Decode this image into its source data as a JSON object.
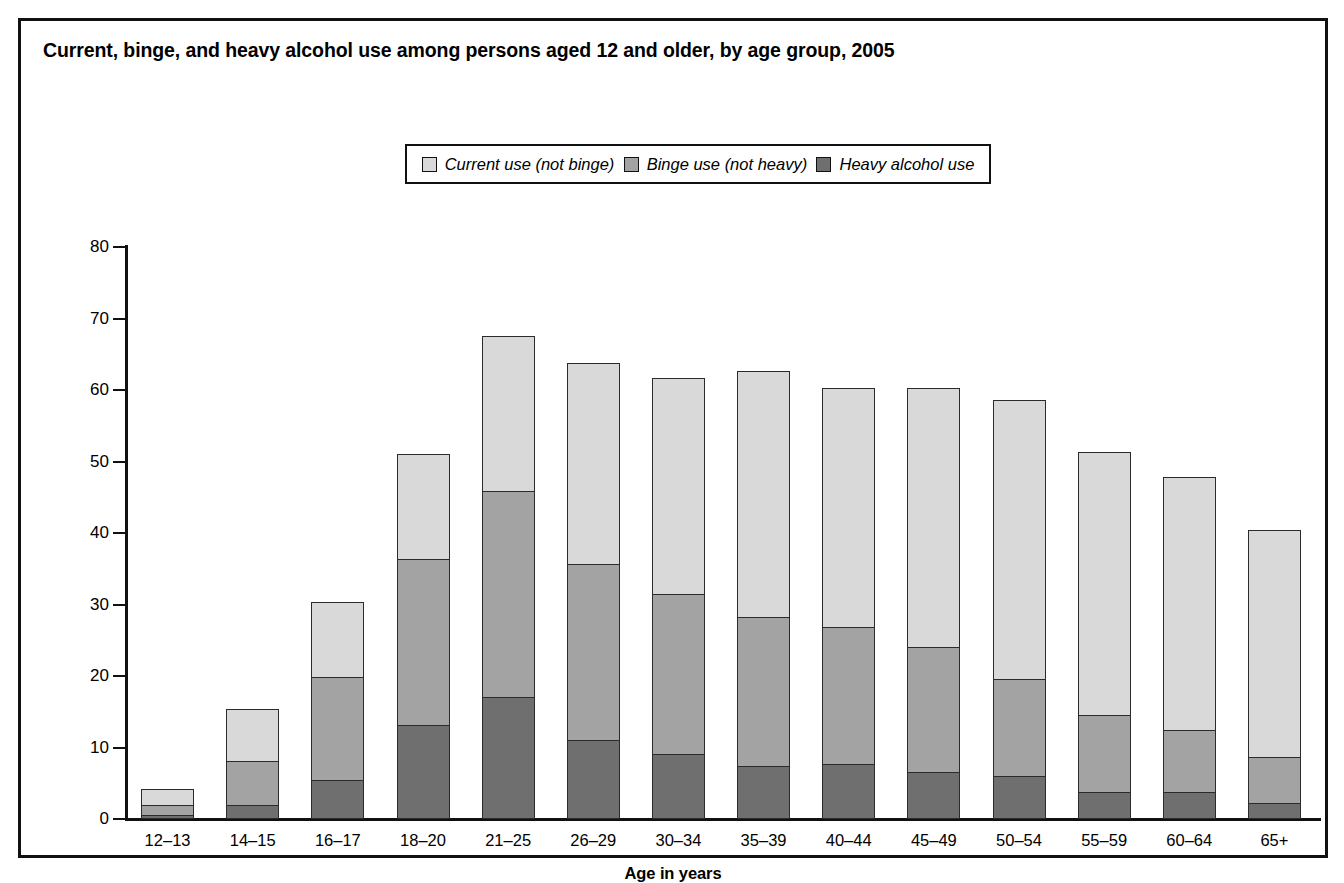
{
  "figure": {
    "title": "Current, binge, and heavy alcohol use among persons aged 12 and older, by age group, 2005"
  },
  "legend": {
    "items": [
      {
        "label": "Current use (not binge)",
        "icon": "legend-swatch-light",
        "color": "#d9d9d9"
      },
      {
        "label": "Binge use (not heavy)",
        "icon": "legend-swatch-medium",
        "color": "#a3a3a3"
      },
      {
        "label": "Heavy alcohol use",
        "icon": "legend-swatch-dark",
        "color": "#6f6f6f"
      }
    ]
  },
  "chart_data": {
    "type": "bar",
    "stacked": true,
    "title": "Current, binge, and heavy alcohol use among persons aged 12 and older, by age group, 2005",
    "xlabel": "Age in years",
    "ylabel": "Percent using in past month",
    "ylim": [
      0,
      80
    ],
    "yticks": [
      0,
      10,
      20,
      30,
      40,
      50,
      60,
      70,
      80
    ],
    "ytick_labels": [
      "0",
      "10",
      "20",
      "30",
      "40",
      "50",
      "60",
      "70",
      "80"
    ],
    "grid": false,
    "legend_position": "top-center",
    "categories": [
      "12–13",
      "14–15",
      "16–17",
      "18–20",
      "21–25",
      "26–29",
      "30–34",
      "35–39",
      "40–44",
      "45–49",
      "50–54",
      "55–59",
      "60–64",
      "65+"
    ],
    "series": [
      {
        "name": "Heavy alcohol use",
        "color": "#6f6f6f",
        "values": [
          0.6,
          2.0,
          5.5,
          13.2,
          17.1,
          11.1,
          9.1,
          7.4,
          7.7,
          6.6,
          6.0,
          3.8,
          3.8,
          2.3
        ]
      },
      {
        "name": "Binge use (not heavy)",
        "color": "#a3a3a3",
        "values": [
          1.4,
          6.1,
          14.4,
          23.2,
          28.8,
          24.5,
          22.4,
          20.8,
          19.1,
          17.4,
          13.6,
          10.7,
          8.7,
          6.4
        ]
      },
      {
        "name": "Current use (not binge)",
        "color": "#d9d9d9",
        "values": [
          2.2,
          7.3,
          10.5,
          14.7,
          21.7,
          28.2,
          30.2,
          34.4,
          33.5,
          36.3,
          39.0,
          36.8,
          35.3,
          31.7
        ]
      }
    ],
    "totals": [
      4.2,
      15.4,
      30.4,
      51.1,
      67.6,
      63.8,
      61.7,
      62.6,
      60.3,
      60.3,
      58.6,
      51.3,
      47.8,
      40.4
    ],
    "cumulative_heavy_plus_binge": [
      2.0,
      8.1,
      19.9,
      36.4,
      45.9,
      35.6,
      31.5,
      28.2,
      26.8,
      24.0,
      19.6,
      14.5,
      12.5,
      8.7
    ]
  }
}
